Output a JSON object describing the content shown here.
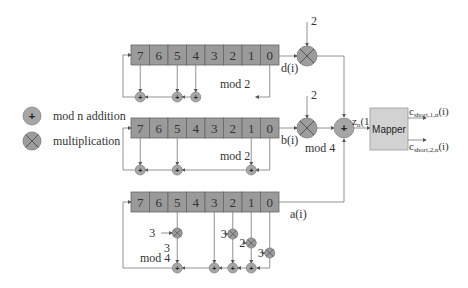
{
  "legend": {
    "adder_label": "mod n addition",
    "mult_label": "multiplication"
  },
  "registers": [
    {
      "name": "d",
      "cells": [
        "7",
        "6",
        "5",
        "4",
        "3",
        "2",
        "1",
        "0"
      ],
      "output_label": "d(i)",
      "mod_label": "mod 2",
      "taps": [
        7,
        5,
        4,
        0
      ],
      "multiplier_const": "2"
    },
    {
      "name": "b",
      "cells": [
        "7",
        "6",
        "5",
        "4",
        "3",
        "2",
        "1",
        "0"
      ],
      "output_label": "b(i)",
      "mod_label": "mod 2",
      "taps": [
        7,
        5,
        1,
        0
      ],
      "multiplier_const": "2",
      "after_mult_label": "mod 4"
    },
    {
      "name": "a",
      "cells": [
        "7",
        "6",
        "5",
        "4",
        "3",
        "2",
        "1",
        "0"
      ],
      "output_label": "a(i)",
      "mod_label": "mod 4",
      "taps": [
        5,
        3,
        2,
        1,
        0
      ],
      "tap_coeffs": {
        "5": "3",
        "2": "3",
        "1": "2",
        "0": "3"
      },
      "extra_const": "3"
    }
  ],
  "summer": {
    "output_label": "z_n(1)",
    "output_main": "z",
    "output_sub": "n",
    "output_arg": "(1)"
  },
  "mapper": {
    "label": "Mapper",
    "outputs": [
      {
        "main": "c",
        "sub": "short,1,n",
        "arg": "(i)"
      },
      {
        "main": "c",
        "sub": "short,2,n",
        "arg": "(i)"
      }
    ]
  },
  "symbols": {
    "plus": "+"
  }
}
